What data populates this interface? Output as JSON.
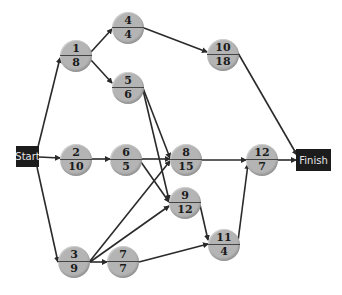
{
  "diagram": {
    "type": "activity-network",
    "colors": {
      "node_fill": "#b4b4b4",
      "edge": "#2a2a2a",
      "terminal_fill": "#1c1c1c",
      "terminal_text": "#e6e6e6"
    },
    "terminals": {
      "start": {
        "label": "Start",
        "x": 16,
        "y": 146,
        "w": 23,
        "h": 21
      },
      "finish": {
        "label": "Finish",
        "x": 296,
        "y": 149,
        "w": 35,
        "h": 22
      }
    },
    "nodes": [
      {
        "id": "n1",
        "top": "1",
        "bottom": "8",
        "cx": 76,
        "cy": 56
      },
      {
        "id": "n4",
        "top": "4",
        "bottom": "4",
        "cx": 128,
        "cy": 28
      },
      {
        "id": "n5",
        "top": "5",
        "bottom": "6",
        "cx": 128,
        "cy": 88
      },
      {
        "id": "n10",
        "top": "10",
        "bottom": "18",
        "cx": 223,
        "cy": 55
      },
      {
        "id": "n2",
        "top": "2",
        "bottom": "10",
        "cx": 76,
        "cy": 160
      },
      {
        "id": "n6",
        "top": "6",
        "bottom": "5",
        "cx": 126,
        "cy": 160
      },
      {
        "id": "n8",
        "top": "8",
        "bottom": "15",
        "cx": 186,
        "cy": 160
      },
      {
        "id": "n12",
        "top": "12",
        "bottom": "7",
        "cx": 262,
        "cy": 160
      },
      {
        "id": "n9",
        "top": "9",
        "bottom": "12",
        "cx": 185,
        "cy": 203
      },
      {
        "id": "n11",
        "top": "11",
        "bottom": "4",
        "cx": 224,
        "cy": 245
      },
      {
        "id": "n3",
        "top": "3",
        "bottom": "9",
        "cx": 74,
        "cy": 262
      },
      {
        "id": "n7",
        "top": "7",
        "bottom": "7",
        "cx": 123,
        "cy": 262
      }
    ],
    "edges": [
      {
        "from": "start",
        "to": "n1",
        "x1": 38,
        "y1": 147,
        "x2": 60,
        "y2": 58
      },
      {
        "from": "start",
        "to": "n2",
        "x1": 39,
        "y1": 157,
        "x2": 60,
        "y2": 158
      },
      {
        "from": "start",
        "to": "n3",
        "x1": 37,
        "y1": 167,
        "x2": 58,
        "y2": 262
      },
      {
        "from": "n1",
        "to": "n4",
        "x1": 91,
        "y1": 52,
        "x2": 112,
        "y2": 29
      },
      {
        "from": "n1",
        "to": "n5",
        "x1": 91,
        "y1": 60,
        "x2": 112,
        "y2": 83
      },
      {
        "from": "n4",
        "to": "n10",
        "x1": 144,
        "y1": 28,
        "x2": 207,
        "y2": 52
      },
      {
        "from": "n10",
        "to": "finish",
        "x1": 238,
        "y1": 53,
        "x2": 297,
        "y2": 155
      },
      {
        "from": "n5",
        "to": "n8",
        "x1": 143,
        "y1": 88,
        "x2": 170,
        "y2": 158
      },
      {
        "from": "n5",
        "to": "n9",
        "x1": 143,
        "y1": 90,
        "x2": 169,
        "y2": 200
      },
      {
        "from": "n2",
        "to": "n6",
        "x1": 92,
        "y1": 159,
        "x2": 110,
        "y2": 159
      },
      {
        "from": "n6",
        "to": "n8",
        "x1": 142,
        "y1": 159,
        "x2": 170,
        "y2": 159
      },
      {
        "from": "n6",
        "to": "n9",
        "x1": 141,
        "y1": 162,
        "x2": 169,
        "y2": 202
      },
      {
        "from": "n3",
        "to": "n8",
        "x1": 90,
        "y1": 261,
        "x2": 170,
        "y2": 161
      },
      {
        "from": "n3",
        "to": "n9",
        "x1": 90,
        "y1": 262,
        "x2": 169,
        "y2": 206
      },
      {
        "from": "n3",
        "to": "n7",
        "x1": 90,
        "y1": 262,
        "x2": 107,
        "y2": 262
      },
      {
        "from": "n7",
        "to": "n11",
        "x1": 139,
        "y1": 262,
        "x2": 208,
        "y2": 244
      },
      {
        "from": "n9",
        "to": "n11",
        "x1": 200,
        "y1": 205,
        "x2": 208,
        "y2": 240
      },
      {
        "from": "n8",
        "to": "n12",
        "x1": 202,
        "y1": 160,
        "x2": 246,
        "y2": 160
      },
      {
        "from": "n11",
        "to": "n12",
        "x1": 238,
        "y1": 241,
        "x2": 248,
        "y2": 164
      },
      {
        "from": "n12",
        "to": "finish",
        "x1": 278,
        "y1": 160,
        "x2": 296,
        "y2": 160
      }
    ]
  }
}
